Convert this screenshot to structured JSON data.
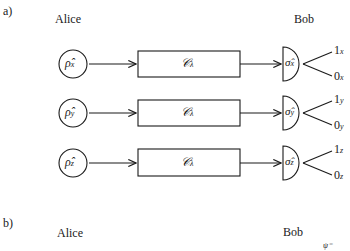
{
  "panel_a": {
    "label": "a)",
    "alice_label": "Alice",
    "bob_label": "Bob",
    "rows": [
      {
        "state": "ρ̂",
        "state_sub": "x",
        "channel": "𝒞",
        "channel_sub": "λ⃗",
        "measurement": "σ̂",
        "measurement_sub": "x",
        "out_1": "1",
        "out_1_sub": "x",
        "out_0": "0",
        "out_0_sub": "x"
      },
      {
        "state": "ρ̂",
        "state_sub": "y",
        "channel": "𝒞",
        "channel_sub": "λ⃗",
        "measurement": "σ̂",
        "measurement_sub": "y",
        "out_1": "1",
        "out_1_sub": "y",
        "out_0": "0",
        "out_0_sub": "y"
      },
      {
        "state": "ρ̂",
        "state_sub": "z",
        "channel": "𝒞",
        "channel_sub": "λ⃗",
        "measurement": "σ̂",
        "measurement_sub": "z",
        "out_1": "1",
        "out_1_sub": "z",
        "out_0": "0",
        "out_0_sub": "z"
      }
    ]
  },
  "panel_b": {
    "label": "b)",
    "alice_label": "Alice",
    "bob_label": "Bob",
    "partial_text": "ψ⁻"
  },
  "colors": {
    "stroke": "#1a1a1a",
    "background": "#ffffff"
  }
}
